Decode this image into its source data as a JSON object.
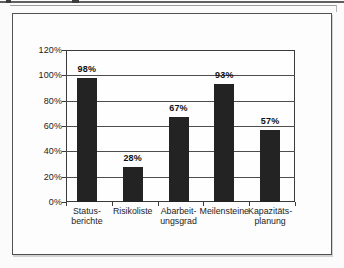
{
  "page": {
    "kind": "scanned-book-figure"
  },
  "colors": {
    "page_background": "#fbfbfb",
    "figure_background": "#fdfdfd",
    "bar": "#232323",
    "gridline": "#4d4d4d",
    "axis": "#3a3a3a",
    "frame_border": "#515151",
    "text": "#1c1c1c"
  },
  "chart_data": {
    "type": "bar",
    "title": "",
    "xlabel": "",
    "ylabel": "",
    "categories": [
      "Statusberichte",
      "Risikoliste",
      "Abarbeitungsgrad",
      "Meilensteine",
      "Kapazitätsplanung"
    ],
    "category_label_lines": [
      [
        "Status-",
        "berichte"
      ],
      [
        "Risikoliste"
      ],
      [
        "Abarbeit-",
        "ungsgrad"
      ],
      [
        "Meilensteine"
      ],
      [
        "Kapazitäts-",
        "planung"
      ]
    ],
    "values": [
      98,
      28,
      67,
      93,
      57
    ],
    "value_labels": [
      "98%",
      "28%",
      "67%",
      "93%",
      "57%"
    ],
    "y_tick_labels": [
      "120%",
      "100%",
      "80%",
      "60%",
      "40%",
      "20%",
      "0%"
    ],
    "y_tick_values": [
      120,
      100,
      80,
      60,
      40,
      20,
      0
    ],
    "ylim": [
      0,
      120
    ],
    "grid": true,
    "legend": false,
    "bar_color": "#232323"
  }
}
